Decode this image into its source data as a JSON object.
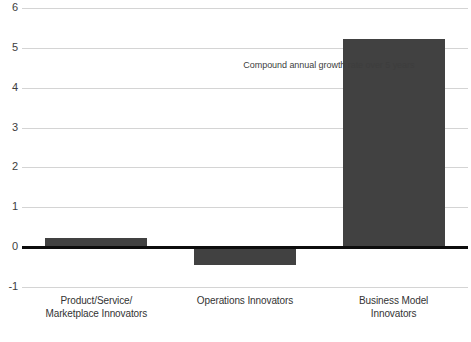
{
  "chart_data": {
    "type": "bar",
    "title": "",
    "subtitle": "",
    "xlabel": "",
    "ylabel": "",
    "categories": [
      "Product/Service/ Marketplace Innovators",
      "Operations Innovators",
      "Business Model Innovators"
    ],
    "category_lines": [
      [
        "Product/Service/",
        "Marketplace Innovators"
      ],
      [
        "Operations Innovators",
        ""
      ],
      [
        "Business Model",
        "Innovators"
      ]
    ],
    "values": [
      0.22,
      -0.45,
      5.22
    ],
    "ylim": [
      -1,
      6
    ],
    "yticks": [
      6,
      5,
      4,
      3,
      2,
      1,
      0,
      -1
    ],
    "ytick_labels": [
      "6",
      "5",
      "4",
      "3",
      "2",
      "1",
      "0",
      "-1"
    ],
    "grid": true,
    "legend": "none",
    "annotations": [
      {
        "text": "Compound annual growth rate over 5 years",
        "x_value": 1.5,
        "y_value": 4.55
      }
    ],
    "colors": {
      "bar": "#414141",
      "gridline": "#d4d4d4",
      "zero_line": "#0d0d0d",
      "text": "#333333",
      "background": "#ffffff"
    }
  }
}
